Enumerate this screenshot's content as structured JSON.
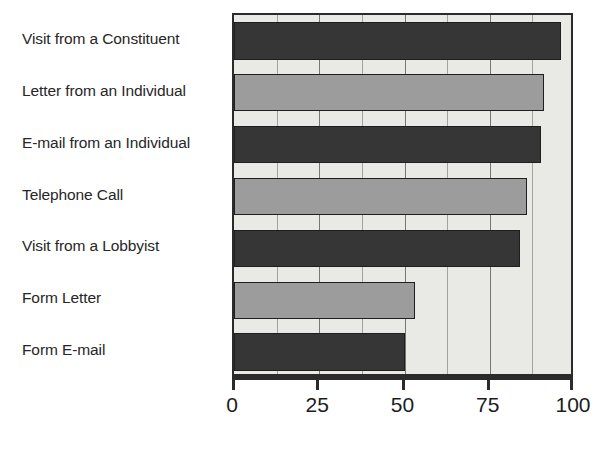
{
  "chart_data": {
    "type": "bar",
    "orientation": "horizontal",
    "title": "",
    "subtitle": "",
    "xlabel": "",
    "ylabel": "",
    "xlim": [
      0,
      100
    ],
    "ylim": null,
    "grid": true,
    "legend": null,
    "xticks": [
      0,
      25,
      50,
      75,
      100
    ],
    "xtick_labels": [
      "0",
      "25",
      "50",
      "75",
      "100"
    ],
    "minor_xticks": [
      12.5,
      37.5,
      62.5,
      87.5
    ],
    "categories": [
      "Visit from a Constituent",
      "Letter from an Individual",
      "E-mail from an Individual",
      "Telephone Call",
      "Visit from a Lobbyist",
      "Form Letter",
      "Form E-mail"
    ],
    "values": [
      96,
      91,
      90,
      86,
      84,
      53,
      50
    ],
    "bar_colors": [
      "#363636",
      "#9c9c9c",
      "#363636",
      "#9c9c9c",
      "#363636",
      "#9c9c9c",
      "#363636"
    ],
    "plot_background": "#e9e9e5",
    "axis_color": "#2b2b2b",
    "gridline_color": "#77776f",
    "bar_edge_color": "#1f1f1f"
  }
}
